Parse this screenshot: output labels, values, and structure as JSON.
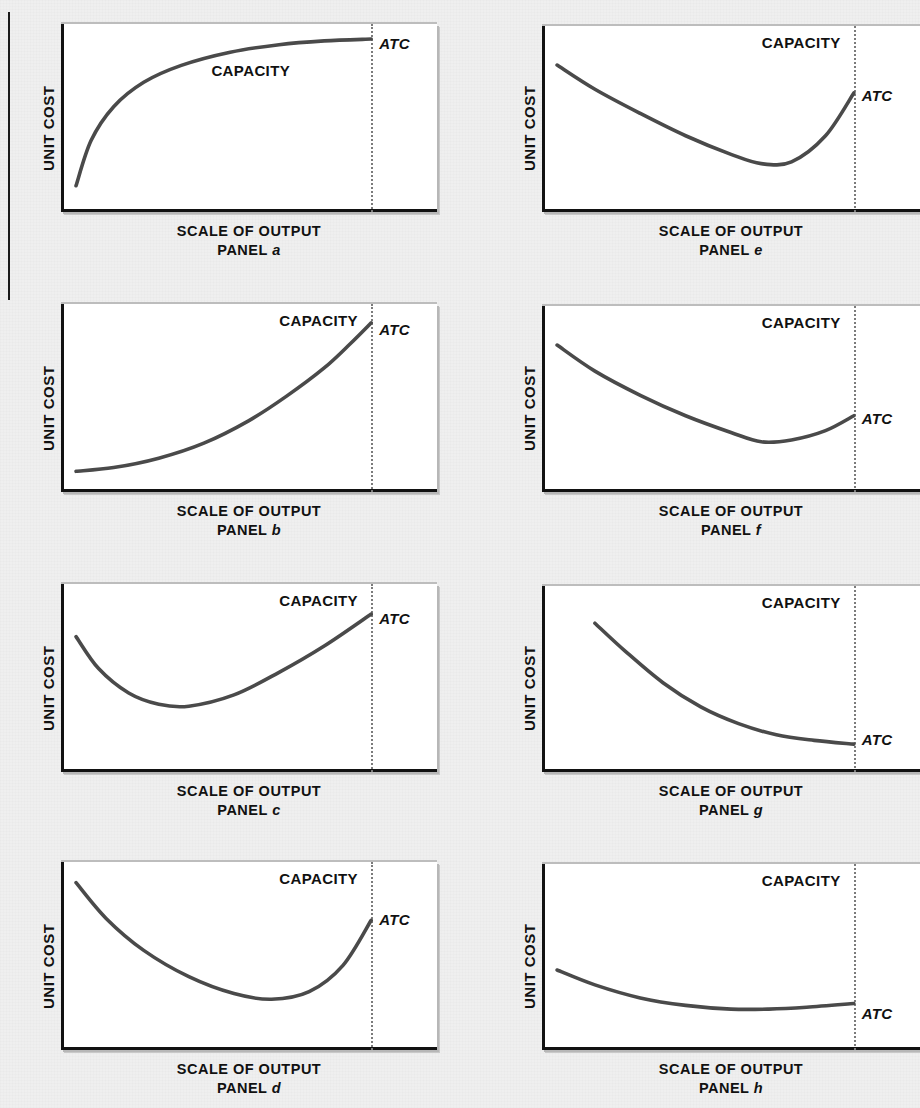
{
  "figure": {
    "background_color": "#eeeeee",
    "curve_color": "#4a4a4a",
    "axis_color": "#121212",
    "capacity_line_color": "#7b7b7b",
    "columns": 2,
    "rows": 4
  },
  "labels": {
    "y_axis": "UNIT COST",
    "x_axis": "SCALE OF OUTPUT",
    "capacity": "CAPACITY",
    "curve": "ATC",
    "panel_word": "PANEL"
  },
  "panels": [
    {
      "id": "a",
      "panel_label": "PANEL",
      "panel_letter": "a",
      "y_axis": "UNIT COST",
      "x_axis": "SCALE OF OUTPUT",
      "capacity": "CAPACITY",
      "curve": "ATC",
      "shape": "rising-concave-plateau",
      "capacity_x_pct": 82.5,
      "capacity_label_pos": "center",
      "atc_y_pct": 6
    },
    {
      "id": "b",
      "panel_label": "PANEL",
      "panel_letter": "b",
      "y_axis": "UNIT COST",
      "x_axis": "SCALE OF OUTPUT",
      "capacity": "CAPACITY",
      "curve": "ATC",
      "shape": "rising-convex",
      "capacity_x_pct": 82.5,
      "capacity_label_pos": "right",
      "atc_y_pct": 9
    },
    {
      "id": "c",
      "panel_label": "PANEL",
      "panel_letter": "c",
      "y_axis": "UNIT COST",
      "x_axis": "SCALE OF OUTPUT",
      "capacity": "CAPACITY",
      "curve": "ATC",
      "shape": "u-shape-early-min",
      "capacity_x_pct": 82.5,
      "capacity_label_pos": "right",
      "atc_y_pct": 14
    },
    {
      "id": "d",
      "panel_label": "PANEL",
      "panel_letter": "d",
      "y_axis": "UNIT COST",
      "x_axis": "SCALE OF OUTPUT",
      "capacity": "CAPACITY",
      "curve": "ATC",
      "shape": "u-shape-broad-min",
      "capacity_x_pct": 82.5,
      "capacity_label_pos": "right",
      "atc_y_pct": 26
    },
    {
      "id": "e",
      "panel_label": "PANEL",
      "panel_letter": "e",
      "y_axis": "UNIT COST",
      "x_axis": "SCALE OF OUTPUT",
      "capacity": "CAPACITY",
      "curve": "ATC",
      "shape": "u-shape-deep-min",
      "capacity_x_pct": 82.5,
      "capacity_label_pos": "right",
      "atc_y_pct": 33
    },
    {
      "id": "f",
      "panel_label": "PANEL",
      "panel_letter": "f",
      "y_axis": "UNIT COST",
      "x_axis": "SCALE OF OUTPUT",
      "capacity": "CAPACITY",
      "curve": "ATC",
      "shape": "u-shape-gentle-rise",
      "capacity_x_pct": 82.5,
      "capacity_label_pos": "right",
      "atc_y_pct": 56
    },
    {
      "id": "g",
      "panel_label": "PANEL",
      "panel_letter": "g",
      "y_axis": "UNIT COST",
      "x_axis": "SCALE OF OUTPUT",
      "capacity": "CAPACITY",
      "curve": "ATC",
      "shape": "falling-convex-flatten",
      "capacity_x_pct": 82.5,
      "capacity_label_pos": "right",
      "atc_y_pct": 78
    },
    {
      "id": "h",
      "panel_label": "PANEL",
      "panel_letter": "h",
      "y_axis": "UNIT COST",
      "x_axis": "SCALE OF OUTPUT",
      "capacity": "CAPACITY",
      "curve": "ATC",
      "shape": "gently-falling-flat",
      "capacity_x_pct": 82.5,
      "capacity_label_pos": "right",
      "atc_y_pct": 76
    }
  ],
  "chart_data": {
    "type": "line",
    "title": "",
    "xlabel": "SCALE OF OUTPUT",
    "ylabel": "UNIT COST",
    "grid": false,
    "legend": "none",
    "annotations": [
      "CAPACITY",
      "ATC"
    ],
    "xlim": [
      0,
      100
    ],
    "ylim": [
      0,
      100
    ],
    "note": "Average total cost (ATC) curve shapes vs scale of output; vertical dotted line marks plant CAPACITY at x = 82.5 on a 0-100 scale. x/y are percent of plot-box width/height, y measured from the bottom axis.",
    "series": [
      {
        "name": "PANEL a",
        "description": "ATC rises steeply then flattens (concave, plateaus at capacity)",
        "x": [
          4,
          8,
          14,
          22,
          32,
          45,
          58,
          70,
          82.5
        ],
        "y": [
          14,
          38,
          56,
          69,
          78,
          85,
          89,
          91,
          92
        ]
      },
      {
        "name": "PANEL b",
        "description": "ATC rises slowly then steeply (convex, exponential)",
        "x": [
          4,
          14,
          26,
          38,
          50,
          60,
          70,
          77,
          82.5
        ],
        "y": [
          11,
          13,
          18,
          26,
          38,
          51,
          66,
          79,
          90
        ]
      },
      {
        "name": "PANEL c",
        "description": "U-shaped ATC with minimum early, rising to capacity",
        "x": [
          4,
          10,
          18,
          26,
          34,
          46,
          58,
          70,
          82.5
        ],
        "y": [
          72,
          55,
          42,
          36,
          35,
          41,
          53,
          67,
          84
        ]
      },
      {
        "name": "PANEL d",
        "description": "Broad U-shaped ATC, minimum near the middle, sharp rise at capacity",
        "x": [
          4,
          12,
          22,
          34,
          46,
          56,
          66,
          75,
          82.5
        ],
        "y": [
          89,
          70,
          53,
          39,
          30,
          27,
          31,
          45,
          69
        ]
      },
      {
        "name": "PANEL e",
        "description": "U-shaped ATC, deep minimum around 60% of output, rising to capacity",
        "x": [
          4,
          14,
          26,
          38,
          50,
          58,
          66,
          75,
          82.5
        ],
        "y": [
          79,
          66,
          53,
          41,
          31,
          26,
          27,
          41,
          64
        ]
      },
      {
        "name": "PANEL f",
        "description": "U-shaped ATC with gentle rise after the minimum",
        "x": [
          4,
          14,
          26,
          38,
          50,
          58,
          66,
          75,
          82.5
        ],
        "y": [
          79,
          65,
          52,
          41,
          32,
          27,
          28,
          33,
          41
        ]
      },
      {
        "name": "PANEL g",
        "description": "ATC falls steeply then flattens toward capacity",
        "x": [
          14,
          22,
          32,
          42,
          52,
          62,
          72,
          82.5
        ],
        "y": [
          80,
          65,
          48,
          35,
          26,
          20,
          17,
          15
        ]
      },
      {
        "name": "PANEL h",
        "description": "ATC falls gently and is almost flat across the range",
        "x": [
          4,
          14,
          26,
          38,
          50,
          60,
          70,
          82.5
        ],
        "y": [
          43,
          35,
          28,
          24,
          22,
          22,
          23,
          25
        ]
      }
    ]
  }
}
